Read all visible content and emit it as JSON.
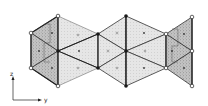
{
  "diagram": {
    "type": "crystal-structure-polyhedra-projection",
    "axes": {
      "vertical": "z",
      "horizontal": "y"
    },
    "colors": {
      "line": "#333333",
      "shade_dark": "#b8b8b8",
      "shade_light": "#e2e2e2",
      "node_filled": "#222222",
      "node_open": "#ffffff"
    },
    "node_types": [
      "open-circle",
      "filled-circle"
    ]
  }
}
